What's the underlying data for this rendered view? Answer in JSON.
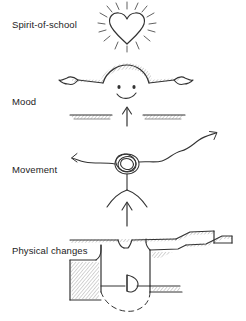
{
  "figure": {
    "background_color": "#ffffff",
    "ink_color": "#333333",
    "style": "hand-drawn pencil sketch diagram"
  },
  "rows": [
    {
      "label": "Spirit-of-school",
      "sketch_name": "radiating-heart-icon",
      "sketch_description": "A hand-drawn heart outline surrounded by short radiating rays, like a shining heart."
    },
    {
      "label": "Mood",
      "sketch_name": "smiling-face-with-open-arms-icon",
      "sketch_description": "A smiling face with a shaded domed head and two outstretched arms ending in hands; below it two hatched horizontal bars with a gap and an upward arrow pointing into the gap."
    },
    {
      "label": "Movement",
      "sketch_name": "figure-with-wavy-arms-icon",
      "sketch_description": "A stick figure with a scribbled round head and splayed legs; its left arm ends in a small arrowhead and its right arm is a wavy line rising to an arrowhead at the upper right. An upward arrow points at the figure from below."
    },
    {
      "label": "Physical changes",
      "sketch_name": "architectural-floor-plan-icon",
      "sketch_description": "A hatched architectural floor plan showing stepped walls in section and a door leaf with a dashed swing arc."
    }
  ]
}
